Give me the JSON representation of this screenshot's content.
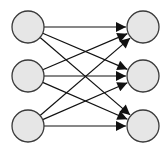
{
  "diagram": {
    "type": "bipartite-fully-connected",
    "colors": {
      "node_fill": "#e6e6e6",
      "node_stroke": "#3a3a3a",
      "edge": "#111111",
      "background": "#ffffff"
    },
    "left_nodes": [
      {
        "id": "L1",
        "cx": 28,
        "cy": 27
      },
      {
        "id": "L2",
        "cx": 28,
        "cy": 76
      },
      {
        "id": "L3",
        "cx": 28,
        "cy": 126
      }
    ],
    "right_nodes": [
      {
        "id": "R1",
        "cx": 143,
        "cy": 27
      },
      {
        "id": "R2",
        "cx": 143,
        "cy": 76
      },
      {
        "id": "R3",
        "cx": 143,
        "cy": 126
      }
    ],
    "node_radius": 16,
    "edges": [
      [
        "L1",
        "R1"
      ],
      [
        "L1",
        "R2"
      ],
      [
        "L1",
        "R3"
      ],
      [
        "L2",
        "R1"
      ],
      [
        "L2",
        "R2"
      ],
      [
        "L2",
        "R3"
      ],
      [
        "L3",
        "R1"
      ],
      [
        "L3",
        "R2"
      ],
      [
        "L3",
        "R3"
      ]
    ]
  }
}
